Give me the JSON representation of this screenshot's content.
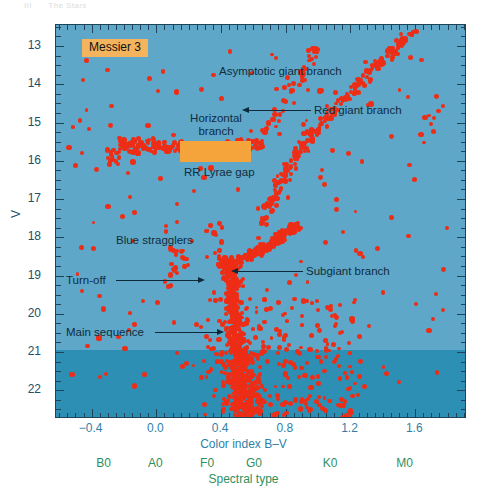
{
  "page_header": {
    "chapter": "III",
    "title": "The Stars"
  },
  "figure": {
    "cluster_badge": "Messier 3",
    "colors": {
      "plot_background": "#5ea7c8",
      "dim_band_background": "#2e8fb5",
      "star_point": "#ee2d16",
      "frame": "#1d4459",
      "badge_background": "#f4b45e",
      "horizontal_branch_box": "#f5a43c",
      "x_axis_text": "#2f7fa8",
      "spectral_text": "#2f8f5e",
      "annotation_text": "#102c3d"
    },
    "annotations": [
      {
        "id": "asymptotic-giant-branch",
        "label": "Asymptotic giant branch"
      },
      {
        "id": "red-giant-branch",
        "label": "Red giant branch"
      },
      {
        "id": "horizontal-branch",
        "label": "Horizontal\nbranch"
      },
      {
        "id": "rr-lyrae-gap",
        "label": "RR Lyrae gap"
      },
      {
        "id": "blue-stragglers",
        "label": "Blue stragglers"
      },
      {
        "id": "turn-off",
        "label": "Turn-off"
      },
      {
        "id": "subgiant-branch",
        "label": "Subgiant branch"
      },
      {
        "id": "main-sequence",
        "label": "Main sequence"
      }
    ],
    "annotation_text": {
      "asymptotic_giant_branch": "Asymptotic giant branch",
      "red_giant_branch": "Red giant branch",
      "horizontal_branch_line1": "Horizontal",
      "horizontal_branch_line2": "branch",
      "rr_lyrae_gap": "RR Lyrae gap",
      "blue_stragglers": "Blue stragglers",
      "turn_off": "Turn-off",
      "subgiant_branch": "Subgiant branch",
      "main_sequence": "Main sequence"
    }
  },
  "chart_data": {
    "type": "scatter",
    "title": "Messier 3",
    "xlabel": "Color index B–V",
    "ylabel": "V",
    "secondary_xlabel": "Spectral type",
    "xlim": [
      -0.62,
      1.92
    ],
    "ylim": [
      22.75,
      12.45
    ],
    "y_inverted": true,
    "grid": false,
    "legend": null,
    "xticks": [
      -0.4,
      0.0,
      0.4,
      0.8,
      1.2,
      1.6
    ],
    "xticklabels": [
      "−0.4",
      "0.0",
      "0.4",
      "0.8",
      "1.2",
      "1.6"
    ],
    "xtick_minor_step": 0.05,
    "yticks": [
      13,
      14,
      15,
      16,
      17,
      18,
      19,
      20,
      21,
      22
    ],
    "yticklabels": [
      "13",
      "14",
      "15",
      "16",
      "17",
      "18",
      "19",
      "20",
      "21",
      "22"
    ],
    "ytick_minor_step": 0.25,
    "spectral_ticks": [
      -0.32,
      0.0,
      0.32,
      0.61,
      1.08,
      1.54
    ],
    "spectral_labels": [
      "B0",
      "A0",
      "F0",
      "G0",
      "K0",
      "M0"
    ],
    "point_color": "#ee2d16",
    "point_size_px": 4.2,
    "n_points_approx": 1100,
    "completeness_band": {
      "label": null,
      "y_start": 21.0,
      "y_end": 22.75,
      "color": "#2e8fb5"
    },
    "features": [
      {
        "name": "Asymptotic giant branch",
        "bv_range": [
          0.55,
          1.05
        ],
        "v_range": [
          12.8,
          15.2
        ]
      },
      {
        "name": "Red giant branch",
        "bv_range": [
          0.62,
          1.62
        ],
        "v_range": [
          12.6,
          17.8
        ]
      },
      {
        "name": "Horizontal branch",
        "bv_range": [
          -0.3,
          0.62
        ],
        "v_range": [
          15.4,
          16.0
        ]
      },
      {
        "name": "RR Lyrae gap",
        "bv_range": [
          0.18,
          0.42
        ],
        "v_range": [
          15.5,
          15.9
        ]
      },
      {
        "name": "Blue stragglers",
        "bv_range": [
          -0.1,
          0.35
        ],
        "v_range": [
          17.4,
          19.2
        ]
      },
      {
        "name": "Turn-off",
        "bv_range": [
          0.42,
          0.52
        ],
        "v_range": [
          18.8,
          19.4
        ]
      },
      {
        "name": "Subgiant branch",
        "bv_range": [
          0.55,
          0.95
        ],
        "v_range": [
          17.6,
          18.9
        ]
      },
      {
        "name": "Main sequence",
        "bv_range": [
          0.45,
          0.8
        ],
        "v_range": [
          19.0,
          22.7
        ]
      }
    ],
    "annotation_markers": [
      {
        "text": "Asymptotic giant branch",
        "bv": 0.42,
        "v": 13.45,
        "arrow": false
      },
      {
        "text": "Red giant branch",
        "bv": 1.22,
        "v": 14.32,
        "arrow": true,
        "points_to": {
          "bv": 0.83,
          "v": 14.3
        }
      },
      {
        "text": "Horizontal branch",
        "bv": 0.13,
        "v": 15.05,
        "arrow": false
      },
      {
        "text": "RR Lyrae gap",
        "bv": 0.21,
        "v": 16.22,
        "arrow": false
      },
      {
        "text": "Blue stragglers",
        "bv": -0.12,
        "v": 18.22,
        "arrow": false
      },
      {
        "text": "Turn-off",
        "bv": -0.35,
        "v": 19.0,
        "arrow": true,
        "points_to": {
          "bv": 0.46,
          "v": 19.0
        }
      },
      {
        "text": "Subgiant branch",
        "bv": 1.02,
        "v": 18.72,
        "arrow": true,
        "points_to": {
          "bv": 0.62,
          "v": 18.72
        }
      },
      {
        "text": "Main sequence",
        "bv": -0.4,
        "v": 20.9,
        "arrow": true,
        "points_to": {
          "bv": 0.52,
          "v": 20.9
        }
      }
    ]
  }
}
